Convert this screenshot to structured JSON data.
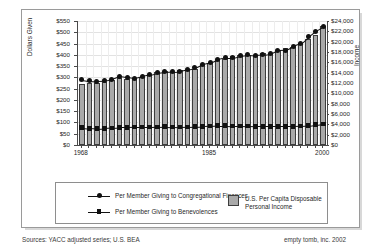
{
  "chart_data": {
    "type": "bar",
    "title": "",
    "subtitle": "",
    "xlabel": "",
    "ylabel": "Dollars Given",
    "y2label": "Income",
    "grid": true,
    "legend_position": "bottom",
    "x": [
      1968,
      1969,
      1970,
      1971,
      1972,
      1973,
      1974,
      1975,
      1976,
      1977,
      1978,
      1979,
      1980,
      1981,
      1982,
      1983,
      1984,
      1985,
      1986,
      1987,
      1988,
      1989,
      1990,
      1991,
      1992,
      1993,
      1994,
      1995,
      1996,
      1997,
      1998,
      1999,
      2000
    ],
    "xtick_labels": [
      "1968",
      "1985",
      "2000"
    ],
    "xtick_years": [
      1968,
      1985,
      2000
    ],
    "ylim": [
      0,
      550
    ],
    "ytick_labels": [
      "$0",
      "$50",
      "$100",
      "$150",
      "$200",
      "$250",
      "$300",
      "$350",
      "$400",
      "$450",
      "$500",
      "$550"
    ],
    "ytick_values": [
      0,
      50,
      100,
      150,
      200,
      250,
      300,
      350,
      400,
      450,
      500,
      550
    ],
    "y2lim": [
      0,
      24000
    ],
    "y2tick_labels": [
      "$0",
      "$2,000",
      "$4,000",
      "$6,000",
      "$8,000",
      "$10,000",
      "$12,000",
      "$14,000",
      "$16,000",
      "$18,000",
      "$20,000",
      "$22,000",
      "$24,000"
    ],
    "y2tick_values": [
      0,
      2000,
      4000,
      6000,
      8000,
      10000,
      12000,
      14000,
      16000,
      18000,
      20000,
      22000,
      24000
    ],
    "series": [
      {
        "name": "U.S. Per Capita Disposable Personal Income",
        "type": "bar",
        "axis": "right",
        "color": "#a9a9a9",
        "values": [
          11900,
          12050,
          11950,
          12100,
          12550,
          13050,
          12850,
          12900,
          13200,
          13550,
          14050,
          14250,
          14200,
          14500,
          14450,
          14800,
          15650,
          15950,
          16400,
          16600,
          17150,
          17500,
          17500,
          17350,
          17800,
          17900,
          18300,
          18700,
          19050,
          19700,
          20600,
          21200,
          23000
        ]
      },
      {
        "name": "Per Member Giving to Congregational Finances",
        "type": "line",
        "axis": "left",
        "marker": "circle",
        "color": "#111111",
        "values": [
          290,
          285,
          283,
          284,
          292,
          305,
          300,
          296,
          305,
          312,
          320,
          324,
          326,
          327,
          334,
          342,
          358,
          365,
          380,
          388,
          388,
          396,
          400,
          398,
          400,
          404,
          420,
          421,
          437,
          450,
          480,
          505,
          525
        ]
      },
      {
        "name": "Per Member Giving to Benevolences",
        "type": "line",
        "axis": "left",
        "marker": "square",
        "color": "#111111",
        "values": [
          77,
          74,
          72,
          74,
          76,
          78,
          78,
          79,
          79,
          79,
          80,
          81,
          80,
          79,
          80,
          81,
          83,
          84,
          86,
          86,
          85,
          85,
          84,
          83,
          83,
          83,
          83,
          83,
          83,
          84,
          86,
          90,
          94
        ]
      }
    ]
  },
  "legend": {
    "entries": [
      {
        "label": "Per Member Giving to Congregational Finances",
        "marker": "circle"
      },
      {
        "label": "Per Member Giving to Benevolences",
        "marker": "square"
      },
      {
        "label": "U.S. Per Capita Disposable\nPersonal Income",
        "marker": "swatch"
      }
    ],
    "income_label_line1": "U.S. Per Capita Disposable",
    "income_label_line2": "Personal Income"
  },
  "footer": {
    "sources": "Sources: YACC adjusted series; U.S. BEA",
    "credit": "empty tomb, inc. 2002"
  }
}
